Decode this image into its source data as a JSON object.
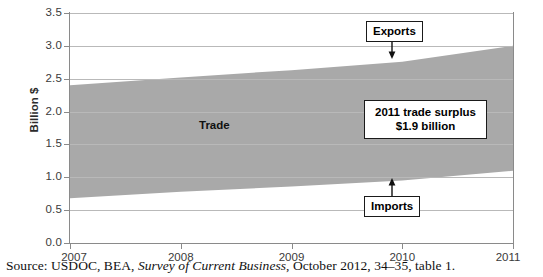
{
  "chart_data": {
    "type": "area",
    "title": "",
    "xlabel": "",
    "ylabel": "Billion $",
    "x": [
      2007,
      2008,
      2009,
      2010,
      2011
    ],
    "xlim": [
      2007,
      2011
    ],
    "ylim": [
      0.0,
      3.5
    ],
    "ytick_values": [
      "0.0",
      "0.5",
      "1.0",
      "1.5",
      "2.0",
      "2.5",
      "3.0",
      "3.5"
    ],
    "xtick_values": [
      "2007",
      "2008",
      "2009",
      "2010",
      "2011"
    ],
    "grid": true,
    "legend": "none",
    "band_fill_color": "#a9a9a9",
    "series": [
      {
        "name": "Exports",
        "values": [
          2.4,
          2.52,
          2.63,
          2.76,
          3.0
        ]
      },
      {
        "name": "Imports",
        "values": [
          0.68,
          0.78,
          0.86,
          0.95,
          1.1
        ]
      }
    ],
    "band_label": "Trade",
    "annotations": [
      {
        "name": "exports",
        "label": "Exports"
      },
      {
        "name": "imports",
        "label": "Imports"
      },
      {
        "name": "surplus",
        "line1": "2011 trade surplus",
        "line2": "$1.9 billion"
      }
    ]
  },
  "axis": {
    "y_title": "Billion $",
    "y_labels": [
      "3.5",
      "3.0",
      "2.5",
      "2.0",
      "1.5",
      "1.0",
      "0.5",
      "0.0"
    ],
    "x_labels": [
      "2007",
      "2008",
      "2009",
      "2010",
      "2011"
    ]
  },
  "annotations": {
    "exports_label": "Exports",
    "imports_label": "Imports",
    "surplus_line1": "2011 trade surplus",
    "surplus_line2": "$1.9 billion",
    "trade_label": "Trade"
  },
  "source": {
    "prefix": "Source: USDOC, BEA, ",
    "italic": "Survey of Current Business",
    "suffix": ", October 2012, 34–35, table 1."
  }
}
